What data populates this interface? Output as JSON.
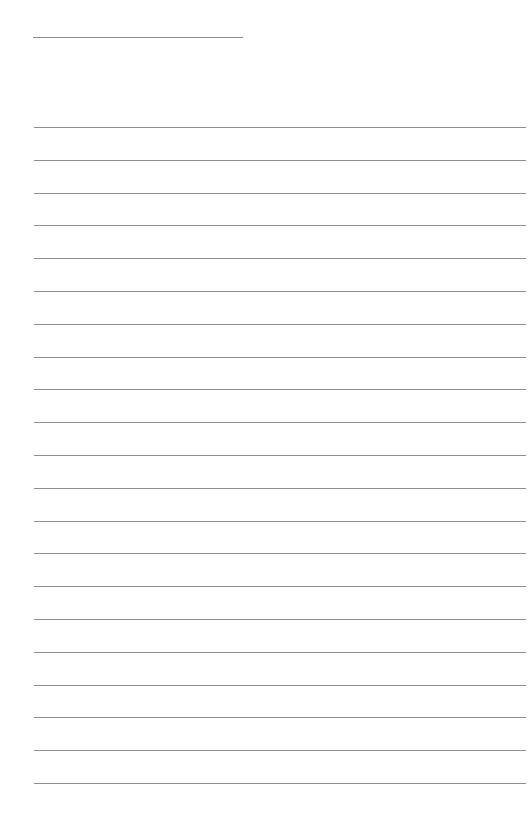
{
  "document": {
    "type": "blank lined sheet",
    "header_field": {
      "label": "",
      "value": ""
    },
    "writing_lines": {
      "count": 21,
      "first_line_y": 127,
      "spacing": 32.8,
      "values": [
        "",
        "",
        "",
        "",
        "",
        "",
        "",
        "",
        "",
        "",
        "",
        "",
        "",
        "",
        "",
        "",
        "",
        "",
        "",
        "",
        ""
      ]
    },
    "colors": {
      "background": "#ffffff",
      "rule": "#8f8f8f"
    }
  }
}
